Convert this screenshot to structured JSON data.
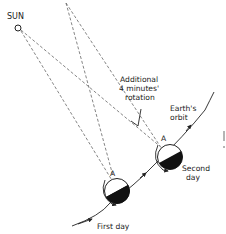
{
  "diagram": {
    "labels": {
      "sun": "SUN",
      "additional_line1": "Additional",
      "additional_line2": "4 minutes'",
      "additional_line3": "rotation",
      "orbit_line1": "Earth's",
      "orbit_line2": "orbit",
      "point_a_first": "A",
      "point_a_second": "A",
      "second_day_line1": "Second",
      "second_day_line2": "day",
      "first_day": "First day"
    },
    "colors": {
      "ink": "#222222",
      "dashed": "#666666",
      "night_side": "#111111",
      "background": "#ffffff"
    }
  }
}
